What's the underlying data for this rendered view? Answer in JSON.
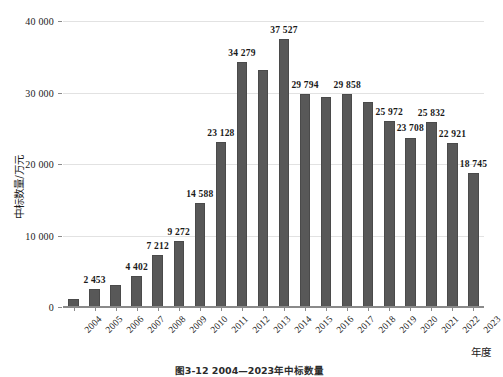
{
  "figure": {
    "caption": "图3-12  2004—2023年中标数量"
  },
  "chart_data": {
    "type": "bar",
    "title": "",
    "subtitle": "",
    "xlabel": "年度",
    "ylabel": "中标数量/万元",
    "categories": [
      "2004",
      "2005",
      "2006",
      "2007",
      "2008",
      "2009",
      "2010",
      "2011",
      "2012",
      "2013",
      "2014",
      "2015",
      "2016",
      "2017",
      "2018",
      "2019",
      "2020",
      "2021",
      "2022",
      "2023"
    ],
    "values": [
      1100,
      2453,
      3100,
      4402,
      7212,
      9272,
      14588,
      23128,
      34279,
      33100,
      37527,
      29794,
      29350,
      29858,
      28650,
      25972,
      23708,
      25832,
      22921,
      18745
    ],
    "data_labels": [
      "",
      "2 453",
      "",
      "4 402",
      "7 212",
      "9 272",
      "14 588",
      "23 128",
      "34 279",
      "",
      "37 527",
      "29 794",
      "",
      "29 858",
      "",
      "25 972",
      "23 708",
      "25 832",
      "22 921",
      "18 745"
    ],
    "ylim": [
      0,
      40000
    ],
    "yticks": [
      0,
      10000,
      20000,
      30000,
      40000
    ],
    "ytick_labels": [
      "0",
      "10 000",
      "20 000",
      "30 000",
      "40 000"
    ],
    "grid": true,
    "legend": false,
    "legend_position": "none",
    "bar_color": "#585858",
    "grid_color": "#e2e2e2",
    "axis_color": "#8a8a8a"
  }
}
